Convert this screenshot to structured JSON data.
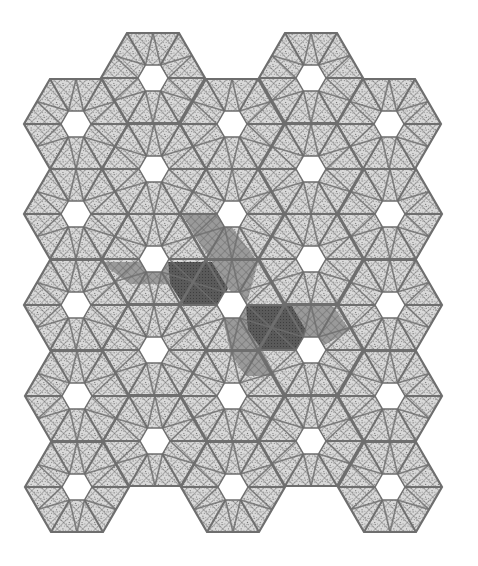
{
  "figure": {
    "title": "",
    "colors": {
      "background": "#ffffff",
      "tile_fill": "#c8c8c8",
      "line": "#6e6e6e",
      "hatch": "#8a8a8a",
      "medium_dark": "#8c8c8c",
      "dark": "#555555",
      "hole": "#ffffff"
    },
    "tile_radius": 52,
    "hole_radius": 15,
    "tiles": [
      {
        "x": 153,
        "y": 78
      },
      {
        "x": 311,
        "y": 78
      },
      {
        "x": 76,
        "y": 124
      },
      {
        "x": 232,
        "y": 124
      },
      {
        "x": 389,
        "y": 124
      },
      {
        "x": 154,
        "y": 169
      },
      {
        "x": 311,
        "y": 169
      },
      {
        "x": 76,
        "y": 214
      },
      {
        "x": 232,
        "y": 214
      },
      {
        "x": 390,
        "y": 214
      },
      {
        "x": 154,
        "y": 259
      },
      {
        "x": 311,
        "y": 259
      },
      {
        "x": 76,
        "y": 305
      },
      {
        "x": 232,
        "y": 305
      },
      {
        "x": 390,
        "y": 305
      },
      {
        "x": 154,
        "y": 350
      },
      {
        "x": 311,
        "y": 350
      },
      {
        "x": 77,
        "y": 396
      },
      {
        "x": 232,
        "y": 396
      },
      {
        "x": 390,
        "y": 396
      },
      {
        "x": 155,
        "y": 441
      },
      {
        "x": 311,
        "y": 441
      },
      {
        "x": 77,
        "y": 487
      },
      {
        "x": 233,
        "y": 487
      },
      {
        "x": 390,
        "y": 487
      }
    ],
    "dark_regions": [
      {
        "points": "168,262 212,262 228,288 220,306 184,306 170,284"
      },
      {
        "points": "246,306 292,306 306,330 298,350 262,350 248,330"
      }
    ],
    "medium_regions": [
      {
        "points": "182,214 222,214 258,262 212,262 196,238"
      },
      {
        "points": "212,262 258,262 246,306 228,288"
      },
      {
        "points": "220,306 246,306 262,350 230,350"
      },
      {
        "points": "292,306 332,306 350,330 316,350 298,350 306,330"
      },
      {
        "points": "100,262 168,262 170,284 130,284"
      },
      {
        "points": "228,350 262,350 276,376 246,376"
      }
    ]
  }
}
